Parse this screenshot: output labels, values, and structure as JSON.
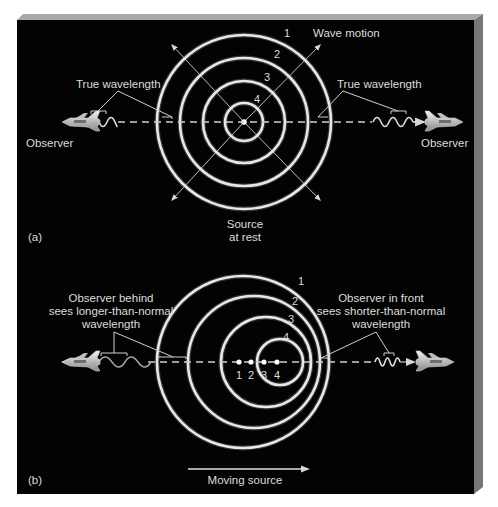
{
  "figure": {
    "background": "#000000",
    "bevel_colors": {
      "top": "#9a9a9a",
      "right": "#7a7a7a"
    }
  },
  "panel_a": {
    "label": "(a)",
    "source_label_line1": "Source",
    "source_label_line2": "at rest",
    "wave_motion_label": "Wave motion",
    "true_wavelength_left": "True wavelength",
    "true_wavelength_right": "True wavelength",
    "observer_left": "Observer",
    "observer_right": "Observer",
    "wavefront_numbers": [
      "1",
      "2",
      "3",
      "4"
    ],
    "center": {
      "x": 244,
      "y": 122
    },
    "radii": [
      87,
      64,
      41,
      19
    ]
  },
  "panel_b": {
    "label": "(b)",
    "behind_line1": "Observer behind",
    "behind_line2": "sees longer-than-normal",
    "behind_line3": "wavelength",
    "front_line1": "Observer in front",
    "front_line2": "sees shorter-than-normal",
    "front_line3": "wavelength",
    "moving_source_label": "Moving source",
    "wavefront_numbers": [
      "1",
      "2",
      "3",
      "4"
    ],
    "source_position_numbers": [
      "1",
      "2",
      "3",
      "4"
    ],
    "centerline_y": 362,
    "wavefronts": [
      {
        "cx": 243,
        "r": 86
      },
      {
        "cx": 254,
        "r": 66
      },
      {
        "cx": 266,
        "r": 45
      },
      {
        "cx": 280,
        "r": 23
      }
    ]
  }
}
